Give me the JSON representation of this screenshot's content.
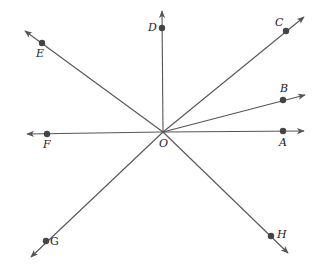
{
  "diagram": {
    "title": "",
    "origin": {
      "label": "O",
      "x": 163,
      "y": 132
    },
    "rays": [
      {
        "id": "OA",
        "point_label": "A",
        "point": [
          283,
          131
        ],
        "tip": [
          304,
          131
        ],
        "label_pos": [
          279,
          146
        ]
      },
      {
        "id": "OB",
        "point_label": "B",
        "point": [
          283,
          100
        ],
        "tip": [
          305,
          95
        ],
        "label_pos": [
          280,
          92
        ]
      },
      {
        "id": "OC",
        "point_label": "C",
        "point": [
          286,
          31
        ],
        "tip": [
          304,
          17
        ],
        "label_pos": [
          275,
          26
        ]
      },
      {
        "id": "OD",
        "point_label": "D",
        "point": [
          162,
          28
        ],
        "tip": [
          162,
          11
        ],
        "label_pos": [
          148,
          31
        ]
      },
      {
        "id": "OE",
        "point_label": "E",
        "point": [
          42,
          43
        ],
        "tip": [
          25,
          31
        ],
        "label_pos": [
          36,
          57
        ]
      },
      {
        "id": "OF",
        "point_label": "F",
        "point": [
          47,
          134
        ],
        "tip": [
          27,
          134
        ],
        "label_pos": [
          43,
          148
        ]
      },
      {
        "id": "OG",
        "point_label": "G",
        "point": [
          46,
          241
        ],
        "tip": [
          31,
          257
        ],
        "label_pos": [
          50,
          245
        ]
      },
      {
        "id": "OH",
        "point_label": "H",
        "point": [
          271,
          236
        ],
        "tip": [
          288,
          253
        ],
        "label_pos": [
          277,
          238
        ]
      }
    ],
    "colors": {
      "line": "#555555",
      "point": "#444444",
      "text": "#222222",
      "background": "#ffffff"
    }
  },
  "labels": {
    "O": "O",
    "A": "A",
    "B": "B",
    "C": "C",
    "D": "D",
    "E": "E",
    "F": "F",
    "G": "G",
    "H": "H"
  }
}
